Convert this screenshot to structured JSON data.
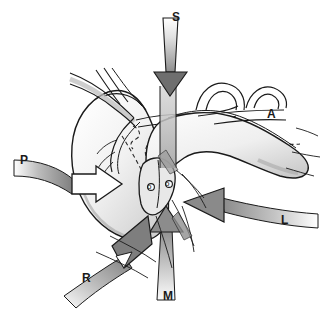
{
  "figure": {
    "kind": "anatomical-line-diagram",
    "palette": {
      "background": "#ffffff",
      "outline": "#1a1a1a",
      "arrow_fill_dark": "#6e6e6e",
      "arrow_fill_mid": "#9a9a9a",
      "arrow_fill_light": "#e6e6e6",
      "organ_shade": "#d9d9d9",
      "organ_highlight": "#f7f7f7",
      "dashed_line": "#2b2b2b",
      "label_color": "#1a1a1a"
    },
    "labels": [
      {
        "id": "S",
        "text": "S",
        "meaning": "superior-approach-arrow",
        "x": 172,
        "y": 11
      },
      {
        "id": "A",
        "text": "A",
        "meaning": "anterior-structure-label",
        "x": 267,
        "y": 108
      },
      {
        "id": "P",
        "text": "P",
        "meaning": "posterior-approach-arrow",
        "x": 20,
        "y": 154
      },
      {
        "id": "L",
        "text": "L",
        "meaning": "left-lateral-approach-arrow",
        "x": 281,
        "y": 214
      },
      {
        "id": "R",
        "text": "R",
        "meaning": "right-approach-arrow",
        "x": 82,
        "y": 272
      },
      {
        "id": "M",
        "text": "M",
        "meaning": "inferior-median-approach-arrow",
        "x": 163,
        "y": 290
      }
    ],
    "orifice_marks": [
      {
        "id": "o-left",
        "text": "o",
        "x": 149,
        "y": 183
      },
      {
        "id": "o-right",
        "text": "o",
        "x": 167,
        "y": 180
      }
    ],
    "arrows": [
      {
        "id": "arrow-s",
        "label": "S",
        "direction": "down",
        "style": "tapered-shaft-dark-head"
      },
      {
        "id": "arrow-p",
        "label": "P",
        "direction": "right",
        "style": "hollow-outline"
      },
      {
        "id": "arrow-l",
        "label": "L",
        "direction": "left",
        "style": "solid-gradient"
      },
      {
        "id": "arrow-m",
        "label": "M",
        "direction": "up",
        "style": "solid-gradient"
      },
      {
        "id": "arrow-r",
        "label": "R",
        "direction": "up-right",
        "style": "solid-gradient"
      }
    ]
  }
}
